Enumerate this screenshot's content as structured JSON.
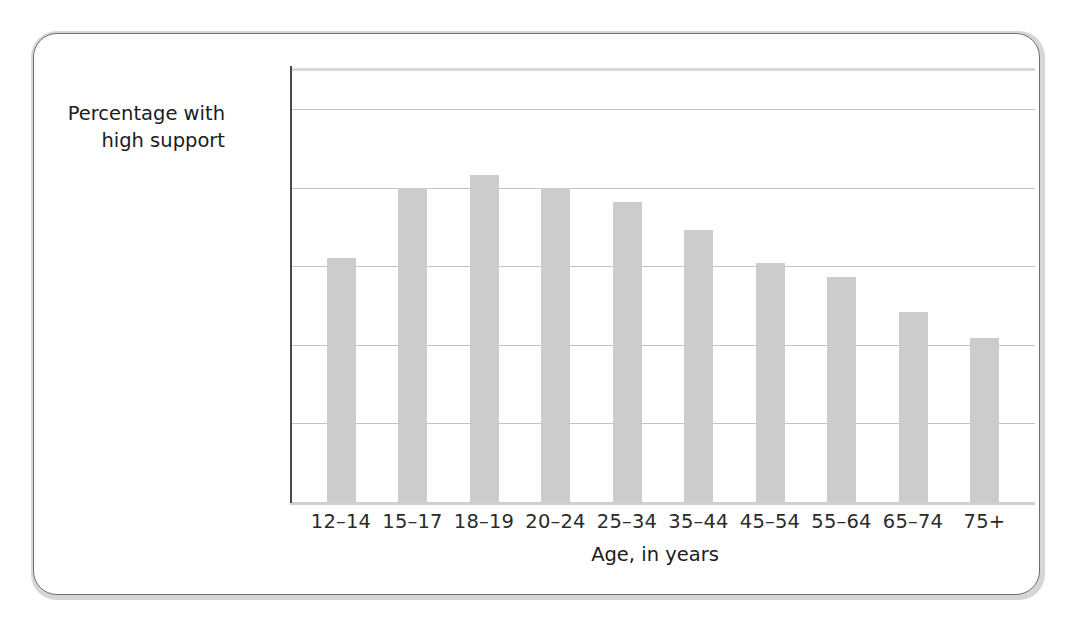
{
  "chart_data": {
    "type": "bar",
    "title": "",
    "xlabel": "Age, in years",
    "ylabel": "Percentage with high support",
    "ylabel_lines": [
      "Percentage with",
      "high support"
    ],
    "categories": [
      "12–14",
      "15–17",
      "18–19",
      "20–24",
      "25–34",
      "35–44",
      "45–54",
      "55–64",
      "65–74",
      "75+"
    ],
    "values": [
      81.0,
      90.0,
      91.6,
      89.9,
      88.2,
      84.6,
      80.4,
      78.6,
      74.2,
      70.9
    ],
    "ylim": [
      50,
      100
    ],
    "yticks": [
      50,
      60,
      70,
      80,
      90,
      100
    ],
    "ytick_labels": [
      "50",
      "60",
      "70",
      "80",
      "90",
      "100%"
    ],
    "grid": true,
    "legend": "none",
    "bar_color": "#cccccc",
    "gridline_color": "#c3c3c3",
    "axis_color": "#4a4a4a",
    "text_color": "#1c1c1c",
    "frame_border_color": "#6e6e6e",
    "background_color": "#ffffff"
  }
}
